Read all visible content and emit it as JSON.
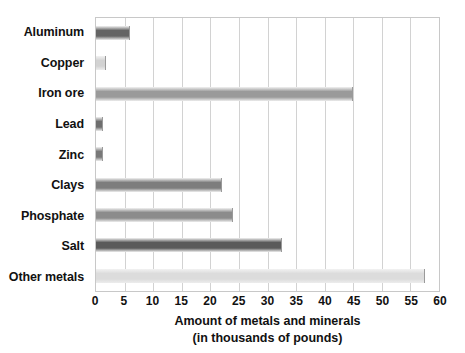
{
  "chart_data": {
    "type": "bar",
    "orientation": "horizontal",
    "title": "",
    "xlabel_line1": "Amount of metals and minerals",
    "xlabel_line2": "(in thousands of pounds)",
    "ylabel": "",
    "xlim": [
      0,
      60
    ],
    "xticks": [
      0,
      5,
      10,
      15,
      20,
      25,
      30,
      35,
      40,
      45,
      50,
      55,
      60
    ],
    "xtick_labels": [
      "0",
      "5",
      "10",
      "15",
      "20",
      "25",
      "30",
      "35",
      "40",
      "45",
      "50",
      "55",
      "60"
    ],
    "grid": "vertical",
    "legend": "none",
    "categories": [
      "Aluminum",
      "Copper",
      "Iron ore",
      "Lead",
      "Zinc",
      "Clays",
      "Phosphate",
      "Salt",
      "Other metals"
    ],
    "values": [
      6,
      1.8,
      45,
      1.2,
      1.2,
      22,
      24,
      32.5,
      57.5
    ],
    "bar_colors": [
      "#646464",
      "#d2d2d2",
      "#9a9a9a",
      "#6e6e6e",
      "#787878",
      "#7d7d7d",
      "#8c8c8c",
      "#5a5a5a",
      "#dcdcdc"
    ]
  },
  "colors": {
    "background": "#ffffff",
    "plot_border": "#c8c8c8",
    "gridline": "#d2d2d2",
    "text": "#111111"
  }
}
